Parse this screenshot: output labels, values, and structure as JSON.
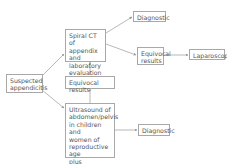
{
  "diagram": {
    "nodes": {
      "suspected": "Suspected\nappendicitis",
      "spiral_ct": "Spiral CT of\nappendix and\nlaboratory\nevaluation",
      "diag_top": "Diagnostic",
      "equiv_right": "Equivocal\nresults",
      "laparoscopy": "Laparoscopy",
      "equiv_mid": "Equivocal results",
      "ultrasound": "Ultrasound of\nabdomen/pelvis\nin children and\nwomen of\nreproductive age\nplus laboratory\nevaluation",
      "diag_bottom": "Diagnostic"
    },
    "edges": [
      [
        "suspected",
        "spiral_ct"
      ],
      [
        "suspected",
        "ultrasound"
      ],
      [
        "spiral_ct",
        "diag_top"
      ],
      [
        "spiral_ct",
        "equiv_right"
      ],
      [
        "equiv_right",
        "laparoscopy"
      ],
      [
        "ultrasound",
        "equiv_mid"
      ],
      [
        "equiv_mid",
        "spiral_ct"
      ],
      [
        "ultrasound",
        "diag_bottom"
      ]
    ],
    "colors": {
      "border": "#a8a8a8",
      "text": "#555555",
      "arrow": "#999999"
    }
  }
}
